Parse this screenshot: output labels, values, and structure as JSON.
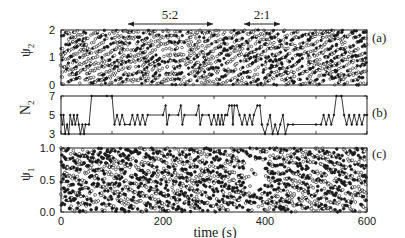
{
  "chart_data": [
    {
      "panel": "(a)",
      "type": "scatter",
      "ylabel": "ψ2",
      "ylim": [
        0,
        2
      ],
      "yticks": [
        "0",
        "1",
        "2"
      ],
      "xlim": [
        0,
        600
      ],
      "description": "Phases of bursting neurons in population 2; dense striped scatter with open and filled circles",
      "annotations": [
        {
          "text": "5:2",
          "x_start": 130,
          "x_end": 290
        },
        {
          "text": "2:1",
          "x_start": 350,
          "x_end": 450
        }
      ],
      "series": [
        {
          "name": "open-circles",
          "marker": "o"
        },
        {
          "name": "filled-circles",
          "marker": "●"
        }
      ]
    },
    {
      "panel": "(b)",
      "type": "line",
      "ylabel": "N2",
      "ylim": [
        3,
        7
      ],
      "yticks": [
        "3",
        "5",
        "7"
      ],
      "xlim": [
        0,
        600
      ],
      "x": [
        0,
        5,
        10,
        15,
        20,
        25,
        30,
        35,
        40,
        45,
        50,
        55,
        60,
        65,
        70,
        75,
        80,
        85,
        90,
        95,
        100,
        105,
        110,
        115,
        120,
        125,
        130,
        135,
        140,
        145,
        150,
        160,
        170,
        180,
        190,
        200,
        205,
        210,
        215,
        220,
        225,
        230,
        235,
        240,
        245,
        250,
        255,
        260,
        270,
        280,
        290,
        295,
        300,
        305,
        310,
        320,
        330,
        340,
        350,
        355,
        360,
        365,
        370,
        375,
        380,
        385,
        390,
        395,
        400,
        405,
        410,
        415,
        420,
        425,
        430,
        435,
        440,
        445,
        450,
        455,
        460,
        465,
        470,
        475,
        480,
        485,
        490,
        495,
        500,
        505,
        510,
        520,
        530,
        540,
        550,
        555,
        560,
        565,
        570,
        575,
        580,
        585,
        590,
        595,
        600
      ],
      "values": [
        5,
        4,
        5,
        3,
        4,
        3,
        5,
        4,
        5,
        4,
        5,
        4,
        3,
        4,
        3,
        4,
        7,
        7,
        7,
        7,
        7,
        7,
        7,
        7,
        7,
        7,
        7,
        7,
        7,
        7,
        7,
        7,
        7,
        7,
        7,
        7,
        7,
        7,
        7,
        7,
        7,
        7,
        7,
        7,
        7,
        7,
        7,
        7,
        7,
        7,
        7,
        7,
        7,
        7,
        7,
        7,
        7,
        7,
        7,
        7,
        7,
        7,
        7,
        7,
        7,
        7,
        7,
        7,
        7,
        7,
        7,
        7,
        7,
        7,
        7,
        7,
        7,
        7,
        7,
        7,
        7,
        7,
        7,
        7,
        7,
        7,
        7,
        7,
        7,
        7,
        7,
        7,
        7,
        7,
        7,
        7,
        7,
        7,
        7,
        7,
        7,
        7,
        7,
        7,
        7
      ],
      "step_trace": [
        [
          0,
          5
        ],
        [
          3,
          4
        ],
        [
          5,
          5
        ],
        [
          8,
          3
        ],
        [
          12,
          4
        ],
        [
          15,
          3
        ],
        [
          18,
          5
        ],
        [
          22,
          4
        ],
        [
          25,
          5
        ],
        [
          28,
          4
        ],
        [
          32,
          5
        ],
        [
          35,
          4
        ],
        [
          38,
          3
        ],
        [
          42,
          4
        ],
        [
          45,
          3
        ],
        [
          48,
          4
        ],
        [
          55,
          4
        ],
        [
          60,
          7
        ],
        [
          90,
          7
        ],
        [
          100,
          7
        ],
        [
          105,
          4
        ],
        [
          110,
          5
        ],
        [
          115,
          4
        ],
        [
          120,
          5
        ],
        [
          125,
          4
        ],
        [
          135,
          4
        ],
        [
          140,
          5
        ],
        [
          145,
          4
        ],
        [
          150,
          5
        ],
        [
          155,
          4
        ],
        [
          160,
          5
        ],
        [
          165,
          4
        ],
        [
          170,
          5
        ],
        [
          200,
          5
        ],
        [
          205,
          6
        ],
        [
          208,
          4
        ],
        [
          212,
          5
        ],
        [
          230,
          5
        ],
        [
          235,
          6
        ],
        [
          238,
          4
        ],
        [
          242,
          5
        ],
        [
          265,
          5
        ],
        [
          270,
          6
        ],
        [
          273,
          4
        ],
        [
          277,
          5
        ],
        [
          290,
          5
        ],
        [
          295,
          4
        ],
        [
          300,
          5
        ],
        [
          305,
          4
        ],
        [
          308,
          5
        ],
        [
          312,
          4
        ],
        [
          315,
          5
        ],
        [
          318,
          4
        ],
        [
          322,
          5
        ],
        [
          326,
          5
        ],
        [
          330,
          6
        ],
        [
          335,
          6
        ],
        [
          337,
          4
        ],
        [
          340,
          6
        ],
        [
          345,
          6
        ],
        [
          350,
          5
        ],
        [
          355,
          4
        ],
        [
          360,
          5
        ],
        [
          365,
          4
        ],
        [
          370,
          5
        ],
        [
          375,
          4
        ],
        [
          378,
          5
        ],
        [
          385,
          6
        ],
        [
          390,
          6
        ],
        [
          394,
          4
        ],
        [
          400,
          3
        ],
        [
          405,
          4
        ],
        [
          410,
          5
        ],
        [
          415,
          3
        ],
        [
          420,
          4
        ],
        [
          425,
          3
        ],
        [
          430,
          4
        ],
        [
          435,
          5
        ],
        [
          440,
          3
        ],
        [
          445,
          4
        ],
        [
          455,
          4
        ],
        [
          500,
          4
        ],
        [
          510,
          4
        ],
        [
          515,
          5
        ],
        [
          520,
          4
        ],
        [
          525,
          5
        ],
        [
          530,
          4
        ],
        [
          535,
          5
        ],
        [
          540,
          7
        ],
        [
          550,
          7
        ],
        [
          555,
          5
        ],
        [
          560,
          4
        ],
        [
          565,
          5
        ],
        [
          570,
          4
        ],
        [
          575,
          5
        ],
        [
          580,
          4
        ],
        [
          585,
          5
        ],
        [
          590,
          4
        ],
        [
          595,
          5
        ],
        [
          600,
          5
        ]
      ],
      "note": "step trace approximated from the image"
    },
    {
      "panel": "(c)",
      "type": "scatter",
      "ylabel": "ψ1",
      "ylim": [
        0.0,
        1.0
      ],
      "yticks": [
        "0.0",
        "0.5",
        "1.0"
      ],
      "xlim": [
        0,
        600
      ],
      "xlabel": "time (s)",
      "xticks": [
        "0",
        "200",
        "400",
        "600"
      ],
      "description": "Phases of bursting neurons in population 1; dense scatter with open and filled circles",
      "series": [
        {
          "name": "open-circles",
          "marker": "o"
        },
        {
          "name": "filled-circles",
          "marker": "●"
        }
      ]
    }
  ],
  "labels": {
    "xlabel": "time (s)",
    "panel_a": "(a)",
    "panel_b": "(b)",
    "panel_c": "(c)",
    "ylabel_a": "ψ",
    "ylabel_a_sub": "2",
    "ylabel_b": "N",
    "ylabel_b_sub": "2",
    "ylabel_c": "ψ",
    "ylabel_c_sub": "1",
    "ann1": "5:2",
    "ann2": "2:1",
    "xt0": "0",
    "xt1": "200",
    "xt2": "400",
    "xt3": "600",
    "ya0": "0",
    "ya1": "1",
    "ya2": "2",
    "yb0": "3",
    "yb1": "5",
    "yb2": "7",
    "yc0": "0.0",
    "yc1": "0.5",
    "yc2": "1.0"
  },
  "colors": {
    "ink": "#1a1a1a",
    "background": "#ffffff"
  }
}
